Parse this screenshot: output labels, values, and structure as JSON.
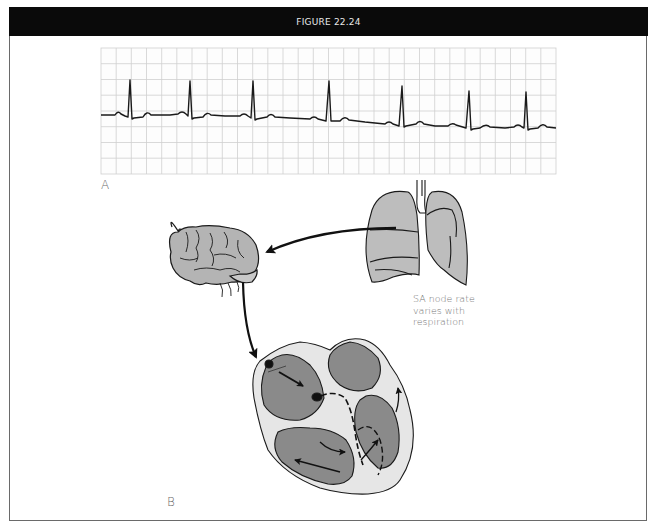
{
  "header": {
    "title": "FIGURE 22.24"
  },
  "panels": {
    "a": {
      "label": "A",
      "content": "ecg-strip"
    },
    "b": {
      "label": "B",
      "content": "brain-lung-heart-pathway"
    }
  },
  "caption": {
    "lines": [
      "SA node rate",
      "varies with",
      "respiration"
    ]
  },
  "ecg": {
    "grid": {
      "x0": 101,
      "y0": 48,
      "x1": 556,
      "y1": 174,
      "spacing": 15.5,
      "color": "#c8c8c8"
    },
    "r_peaks_x": [
      129,
      189,
      252,
      329,
      402,
      469,
      525
    ],
    "trace_color": "#1a1a1a"
  },
  "colors": {
    "header_bg": "#0a0a0a",
    "organ_fill": "#b4b4b4",
    "heart_chamber": "#8a8a8a",
    "heart_wall": "#e6e6e6",
    "outline": "#1a1a1a"
  }
}
